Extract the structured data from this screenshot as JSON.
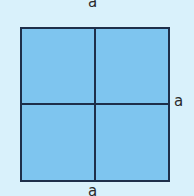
{
  "figure": {
    "shape": "square divided into four equal squares",
    "labels": {
      "top": "a",
      "right": "a",
      "bottom": "a"
    },
    "colors": {
      "fill": "#7ec5ef",
      "stroke": "#1e2f4a",
      "background": "#d9f1fb"
    }
  }
}
